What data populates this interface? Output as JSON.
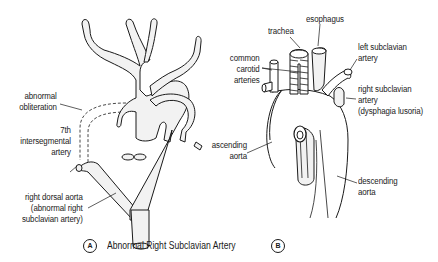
{
  "figure": {
    "panel_a": {
      "badge": "A",
      "caption": "Abnormal Right Subclavian Artery",
      "labels": {
        "abnormal_obliteration": [
          "abnormal",
          "obliteration"
        ],
        "seventh_intersegmental": [
          "7th",
          "intersegmental",
          "artery"
        ],
        "right_dorsal_aorta": [
          "right dorsal aorta",
          "(abnormal right",
          "subclavian artery)"
        ]
      }
    },
    "panel_b": {
      "badge": "B",
      "labels": {
        "trachea": "trachea",
        "esophagus": "esophagus",
        "common_carotid": [
          "common",
          "carotid",
          "arteries"
        ],
        "left_subclavian": [
          "left subclavian",
          "artery"
        ],
        "right_subclavian": [
          "right subclavian",
          "artery",
          "(dysphagia lusoria)"
        ],
        "ascending_aorta": [
          "ascending",
          "aorta"
        ],
        "descending_aorta": [
          "descending",
          "aorta"
        ]
      }
    },
    "colors": {
      "ink": "#1a1a1a",
      "vessel_fill": "#f2f2f2",
      "background": "#ffffff"
    }
  }
}
